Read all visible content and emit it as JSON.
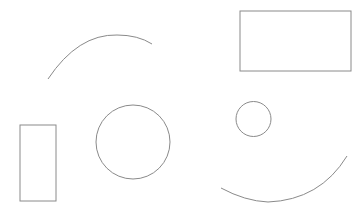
{
  "canvas": {
    "width": 363,
    "height": 216,
    "background": "#ffffff"
  },
  "style": {
    "stroke": "#8a8a8a"
  },
  "shapes": {
    "arc_top": {
      "type": "arc",
      "d": "M48 79 Q78 34 117 35 Q138 35 152 44"
    },
    "rect_top_right": {
      "type": "rect",
      "x": 240,
      "y": 11,
      "width": 111,
      "height": 60
    },
    "rect_left": {
      "type": "rect",
      "x": 20,
      "y": 125,
      "width": 36,
      "height": 76
    },
    "circle_large": {
      "type": "circle",
      "cx": 133,
      "cy": 142,
      "r": 37
    },
    "circle_small": {
      "type": "circle",
      "cx": 253.5,
      "cy": 119,
      "r": 17.5
    },
    "arc_bottom": {
      "type": "arc",
      "d": "M221 188 Q245 201 268 202 Q320 200 347 156"
    }
  }
}
